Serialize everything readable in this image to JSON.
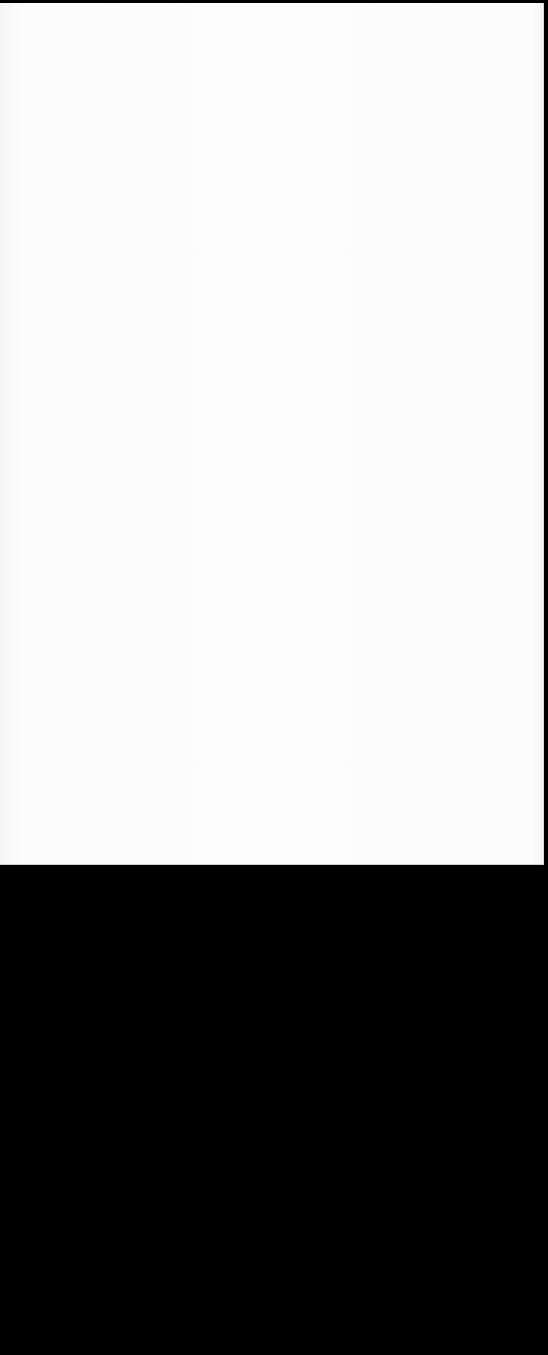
{
  "screen": {
    "background_color": "#000000",
    "panel": {
      "background_color": "#fbfbfb",
      "content": []
    },
    "lower_area": {
      "background_color": "#000000"
    }
  }
}
